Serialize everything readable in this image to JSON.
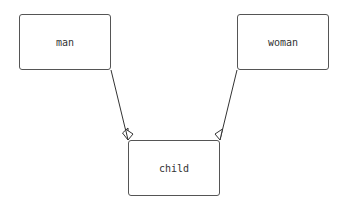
{
  "diagram": {
    "type": "class-inheritance",
    "nodes": [
      {
        "id": "man",
        "label": "man",
        "x": 19,
        "y": 14,
        "w": 92,
        "h": 56
      },
      {
        "id": "woman",
        "label": "woman",
        "x": 237,
        "y": 14,
        "w": 92,
        "h": 56
      },
      {
        "id": "child",
        "label": "child",
        "x": 128,
        "y": 140,
        "w": 92,
        "h": 56
      }
    ],
    "edges": [
      {
        "from": "man",
        "to": "child",
        "arrow": "open-triangle-at-child"
      },
      {
        "from": "woman",
        "to": "child",
        "arrow": "open-triangle-at-child"
      }
    ],
    "colors": {
      "border": "#555555",
      "line": "#333333",
      "text": "#333333",
      "background": "#ffffff"
    }
  }
}
